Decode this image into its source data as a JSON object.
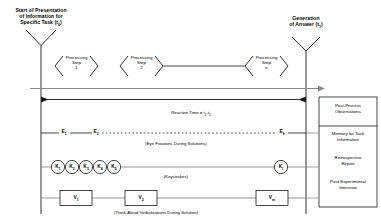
{
  "figure": {
    "title_left": "Start of Presentation of Information for Specific Task (t0)",
    "title_left_lines": [
      "Start of Presentation",
      "of Information for",
      "Specific Task (t",
      "0",
      ")"
    ],
    "left_marker_line1": "Start of Presentation",
    "left_marker_line2": "of Information for",
    "left_marker_line3a": "Specific Task (t",
    "left_marker_line3sub": "0",
    "left_marker_line3b": ")",
    "right_marker_line1": "Generation",
    "right_marker_line2a": "of Answer (t",
    "right_marker_line2sub": "1",
    "right_marker_line2b": ")"
  },
  "processing_steps": [
    {
      "line1": "Processing",
      "line2": "Step",
      "line3": "1"
    },
    {
      "line1": "Processing",
      "line2": "Step",
      "line3": "2"
    },
    {
      "line1": "Processing",
      "line2": "Step",
      "line3": "n"
    }
  ],
  "reaction_time": {
    "text_a": "Reaction Time = t",
    "sub_a": "1",
    "text_b": "-t",
    "sub_b": "0"
  },
  "tracks": [
    {
      "name": "eye-fixations",
      "caption": "(Eye Fixations During Solutions)",
      "nodes": [
        {
          "label": "E",
          "sub": "1"
        },
        {
          "label": "E",
          "sub": "2"
        },
        {
          "label": "E",
          "sub": "k"
        }
      ]
    },
    {
      "name": "keystrokes",
      "caption": "(Keystrokes)",
      "nodes": [
        {
          "label": "K",
          "sub": "1"
        },
        {
          "label": "K",
          "sub": "2"
        },
        {
          "label": "K",
          "sub": "3"
        },
        {
          "label": "K",
          "sub": "4"
        },
        {
          "label": "K",
          "sub": "5"
        },
        {
          "label": "K",
          "sub": "l"
        }
      ]
    },
    {
      "name": "verbalizations",
      "caption": "(Think-Aloud Verbalizations During Solution)",
      "nodes": [
        {
          "label": "V",
          "sub": "1"
        },
        {
          "label": "V",
          "sub": "2"
        },
        {
          "label": "V",
          "sub": "m"
        }
      ]
    }
  ],
  "post_process_panel": {
    "header_line1": "Post-Process",
    "header_line2": "Observations",
    "items": [
      {
        "line1": "Memory for Task",
        "line2": "Information"
      },
      {
        "line1": "Retrospective",
        "line2": "Report"
      },
      {
        "line1": "Post-Experimental",
        "line2": "Interview"
      }
    ]
  },
  "colors": {
    "stroke": "#1a1a1a",
    "grayline": "#8a8a8a",
    "background": "#ffffff"
  }
}
